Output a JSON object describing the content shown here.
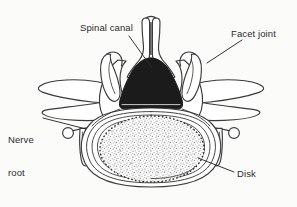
{
  "figure": {
    "type": "anatomical-line-diagram",
    "view": "axial (transverse) cross section",
    "background_color": "#fbfbfa",
    "line_color": "#3a3a3a",
    "fill_color": "#ffffff",
    "label_color": "#2b2b2b"
  },
  "labels": {
    "spinal_canal": "Spinal canal",
    "facet_joint": "Facet joint",
    "nerve_root_line1": "Nerve",
    "nerve_root_line2": "root",
    "disk": "Disk"
  },
  "structures": [
    {
      "name": "spinous-process",
      "label": "Spinous process",
      "labeled_in_figure": false,
      "position": "posterior midline, top",
      "fill": "#ffffff"
    },
    {
      "name": "spinal-canal",
      "label": "Spinal canal",
      "labeled_in_figure": true,
      "position": "central, posterior to vertebral body",
      "fill": "#1b1b1b",
      "shape": "rounded triangular / dome-topped"
    },
    {
      "name": "facet-joint-left",
      "label": "Facet joint",
      "labeled_in_figure": true,
      "position": "posterolateral left",
      "fill": "#ffffff"
    },
    {
      "name": "facet-joint-right",
      "label": "Facet joint",
      "labeled_in_figure": true,
      "position": "posterolateral right",
      "fill": "#ffffff"
    },
    {
      "name": "transverse-process-left",
      "label": "Transverse process",
      "labeled_in_figure": false,
      "position": "lateral left wing",
      "fill": "#ffffff"
    },
    {
      "name": "transverse-process-right",
      "label": "Transverse process",
      "labeled_in_figure": false,
      "position": "lateral right wing",
      "fill": "#ffffff"
    },
    {
      "name": "nerve-root-left",
      "label": "Nerve root",
      "labeled_in_figure": true,
      "position": "lateral left, small circular cross-section",
      "fill": "#ffffff"
    },
    {
      "name": "nerve-root-right",
      "label": "Nerve root",
      "labeled_in_figure": false,
      "position": "lateral right, small circular cross-section",
      "fill": "#ffffff"
    },
    {
      "name": "disk",
      "label": "Disk",
      "labeled_in_figure": true,
      "position": "anterior, large oval body",
      "fill": "#ffffff",
      "detail": "concentric annulus rings with stippled nucleus pulposus"
    }
  ],
  "leader_lines": [
    {
      "name": "spinal-canal-leader",
      "from": "Spinal canal",
      "direction": "down-right"
    },
    {
      "name": "facet-joint-leader",
      "from": "Facet joint",
      "direction": "down-left"
    },
    {
      "name": "nerve-root-leader",
      "from": "Nerve root",
      "direction": "right"
    },
    {
      "name": "disk-leader",
      "from": "Disk",
      "direction": "up-left"
    }
  ]
}
